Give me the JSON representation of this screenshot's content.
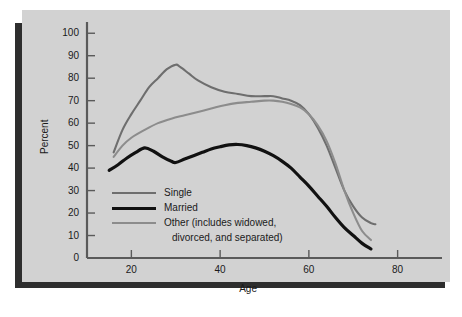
{
  "chart_data": {
    "type": "line",
    "title": "",
    "xlabel": "Age",
    "ylabel": "Percent",
    "xlim": [
      10,
      90
    ],
    "ylim": [
      0,
      105
    ],
    "xticks": [
      20,
      40,
      60,
      80
    ],
    "yticks": [
      0,
      10,
      20,
      30,
      40,
      50,
      60,
      70,
      80,
      90,
      100
    ],
    "grid": false,
    "legend_position": "inside-lower-left",
    "series": [
      {
        "name": "Single",
        "color": "#6e6e6e",
        "x": [
          16,
          18,
          20,
          22,
          24,
          26,
          28,
          30,
          31,
          33,
          35,
          38,
          41,
          44,
          47,
          50,
          52,
          54,
          56,
          58,
          60,
          62,
          64,
          66,
          68,
          70,
          72,
          74,
          75
        ],
        "y": [
          47,
          57,
          64,
          70,
          76,
          80,
          84,
          86,
          85,
          82,
          79,
          76,
          74,
          73,
          72,
          72,
          72,
          71,
          70,
          68,
          64,
          58,
          50,
          40,
          30,
          23,
          18,
          15.5,
          15
        ]
      },
      {
        "name": "Married",
        "color": "#111111",
        "x": [
          15,
          17,
          19,
          21,
          23,
          25,
          27,
          29,
          30,
          32,
          34,
          36,
          38,
          40,
          42,
          44,
          46,
          48,
          50,
          52,
          54,
          56,
          58,
          60,
          62,
          64,
          66,
          68,
          70,
          72,
          74
        ],
        "y": [
          39,
          41.5,
          44.5,
          47,
          49,
          47.5,
          45,
          43,
          42.5,
          44,
          45.5,
          47,
          48.5,
          49.5,
          50.3,
          50.5,
          50,
          49,
          47.5,
          45.5,
          43,
          40,
          36,
          32,
          27.5,
          23,
          18,
          13.5,
          10,
          6.5,
          4
        ]
      },
      {
        "name": "Other (includes widowed, divorced, and separated)",
        "color": "#8c8c8c",
        "x": [
          16,
          18,
          20,
          23,
          26,
          29,
          32,
          35,
          38,
          41,
          44,
          47,
          50,
          52,
          54,
          56,
          58,
          60,
          62,
          64,
          66,
          68,
          70,
          72,
          74
        ],
        "y": [
          45,
          50,
          53.5,
          57,
          60,
          62,
          63.5,
          65,
          66.5,
          68,
          69,
          69.5,
          70,
          70,
          69.5,
          68.5,
          67,
          64,
          59,
          52,
          42,
          30,
          20,
          12,
          8
        ]
      }
    ],
    "legend_entries": [
      {
        "label": "Single",
        "label_line2": "",
        "color": "#6e6e6e",
        "width": 2.1
      },
      {
        "label": "Married",
        "label_line2": "",
        "color": "#111111",
        "width": 3.2
      },
      {
        "label": "Other (includes widowed,",
        "label_line2": "divorced, and separated)",
        "color": "#8c8c8c",
        "width": 2.1
      }
    ],
    "colors": {
      "panel_background": "#d2d2d2",
      "outer_background": "#ffffff",
      "shadow": "#2e2e2e",
      "axis": "#5a5a5a",
      "text": "#1a1a1a"
    }
  }
}
